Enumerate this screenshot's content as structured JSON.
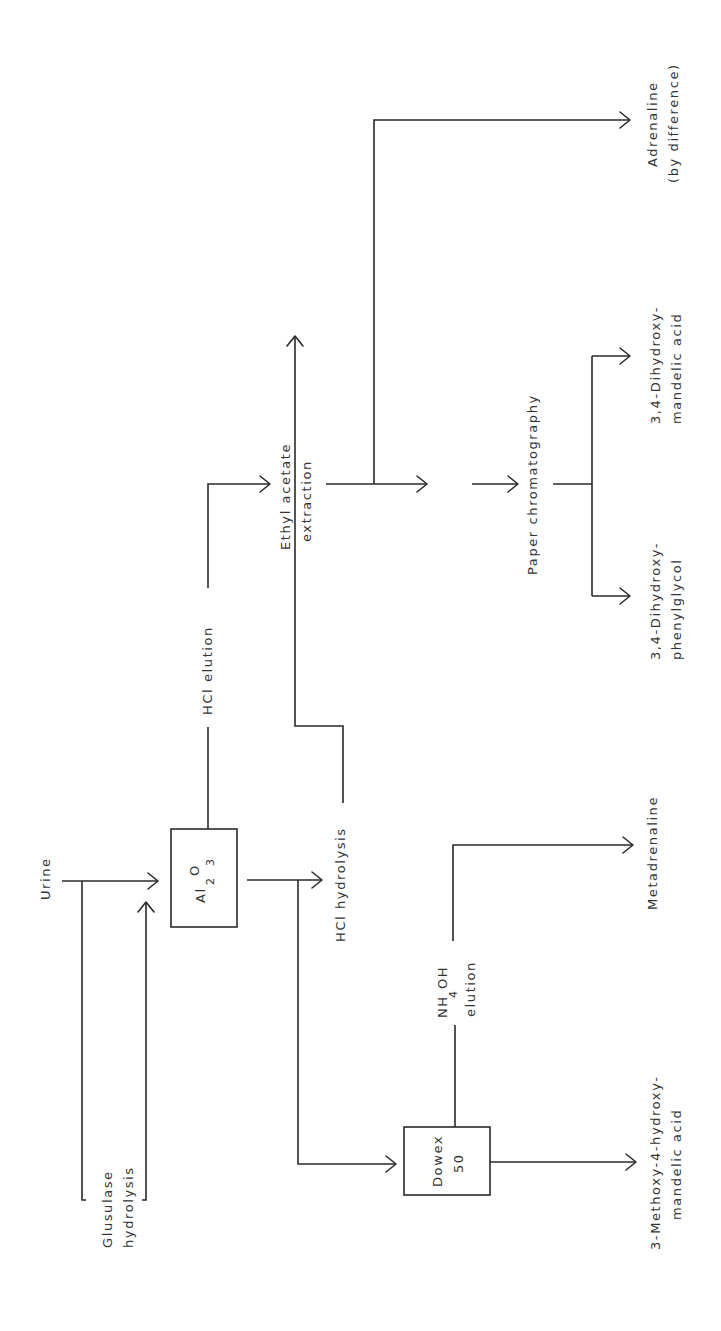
{
  "diagram": {
    "orientation": "rotated-90-ccw",
    "nodes": {
      "urine": "Urine",
      "glusulase_1": "Glusulase",
      "glusulase_2": "hydrolysis",
      "al2o3_main": "Al",
      "al2o3_sub1": "2",
      "al2o3_o": "O",
      "al2o3_sub2": "3",
      "hcl_elution": "HCl elution",
      "hcl_hydrolysis": "HCl hydrolysis",
      "ethyl_1": "Ethyl acetate",
      "ethyl_2": "extraction",
      " och3_pre": "O-CH",
      " och3_sub": "3",
      " och3_post": " derivatives",
      "paper_chrom": "Paper chromatography",
      "dhpg_1": "3,4-Dihydroxy-",
      "dhpg_2": "phenylglycol",
      "dhma_1": "3,4-Dihydroxy-",
      "dhma_2": "mandelic acid",
      "adrenaline_1": "Adrenaline",
      "adrenaline_2": "(by difference)",
      "dowex_1": "Dowex",
      "dowex_2": "50",
      "nh4oh_pre": "NH",
      "nh4oh_sub": "4",
      "nh4oh_post": "OH",
      "nh4oh_elution": "elution",
      "metadrenaline": "Metadrenaline",
      "vma_1": "3-Methoxy-4-hydroxy-",
      "vma_2": "mandelic acid"
    },
    "edges": [
      {
        "from": "Urine",
        "to": "Al2O3"
      },
      {
        "from": "Urine",
        "to": "Glusulase hydrolysis"
      },
      {
        "from": "Glusulase hydrolysis",
        "to": "Al2O3"
      },
      {
        "from": "Al2O3",
        "to": "HCl elution"
      },
      {
        "from": "HCl elution",
        "to": "Ethyl acetate extraction"
      },
      {
        "from": "Al2O3",
        "to": "HCl hydrolysis"
      },
      {
        "from": "HCl hydrolysis",
        "to": "Ethyl acetate extraction"
      },
      {
        "from": "Al2O3",
        "to": "Dowex 50"
      },
      {
        "from": "Ethyl acetate extraction",
        "to": "O-CH3 derivatives"
      },
      {
        "from": "Ethyl acetate extraction",
        "to": "Adrenaline (by difference)"
      },
      {
        "from": "O-CH3 derivatives",
        "to": "Paper chromatography"
      },
      {
        "from": "Paper chromatography",
        "to": "3,4-Dihydroxyphenylglycol"
      },
      {
        "from": "Paper chromatography",
        "to": "3,4-Dihydroxymandelic acid"
      },
      {
        "from": "Dowex 50",
        "to": "NH4OH elution"
      },
      {
        "from": "NH4OH elution",
        "to": "Metadrenaline"
      },
      {
        "from": "Dowex 50",
        "to": "3-Methoxy-4-hydroxymandelic acid"
      }
    ]
  }
}
